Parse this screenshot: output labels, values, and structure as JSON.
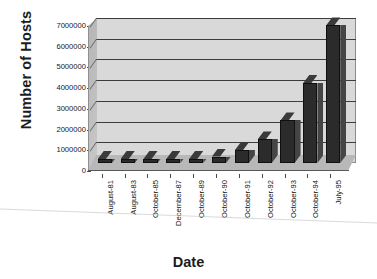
{
  "chart_data": {
    "type": "bar",
    "title": "",
    "xlabel": "Date",
    "ylabel": "Number of Hosts",
    "categories": [
      "August-81",
      "August-83",
      "October-85",
      "December-87",
      "October-89",
      "October-90",
      "October-91",
      "October-92",
      "October-93",
      "October-94",
      "July-95"
    ],
    "values": [
      213,
      562,
      1961,
      28174,
      159000,
      313000,
      617000,
      1136000,
      2056000,
      3864000,
      6642000
    ],
    "ylim": [
      0,
      7000000
    ],
    "yticks": [
      0,
      1000000,
      2000000,
      3000000,
      4000000,
      5000000,
      6000000,
      7000000
    ],
    "ytick_labels": [
      "0",
      "1000000",
      "2000000",
      "3000000",
      "4000000",
      "5000000",
      "6000000",
      "7000000"
    ],
    "grid": true,
    "legend": false,
    "style": "3d-column",
    "bar_color": "#2b2b2b",
    "plot_background": "#d9d9d9"
  }
}
